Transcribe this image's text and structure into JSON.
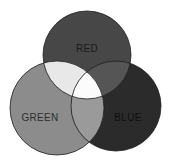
{
  "diagram": {
    "type": "venn",
    "title": "",
    "sets": [
      {
        "id": "red",
        "label": "RED",
        "fill": "#474747",
        "label_color": "#1a1a1a"
      },
      {
        "id": "green",
        "label": "GREEN",
        "fill": "#8c8c8c",
        "label_color": "#2e2e2e"
      },
      {
        "id": "blue",
        "label": "BLUE",
        "fill": "#2b2b2b",
        "label_color": "#0f0f0f"
      }
    ],
    "intersections": [
      {
        "sets": [
          "red",
          "green"
        ],
        "fill": "#e8e8e8"
      },
      {
        "sets": [
          "red",
          "blue"
        ],
        "fill": "#555555"
      },
      {
        "sets": [
          "green",
          "blue"
        ],
        "fill": "#9a9a9a"
      },
      {
        "sets": [
          "red",
          "green",
          "blue"
        ],
        "fill": "#fbfbfb"
      }
    ]
  }
}
